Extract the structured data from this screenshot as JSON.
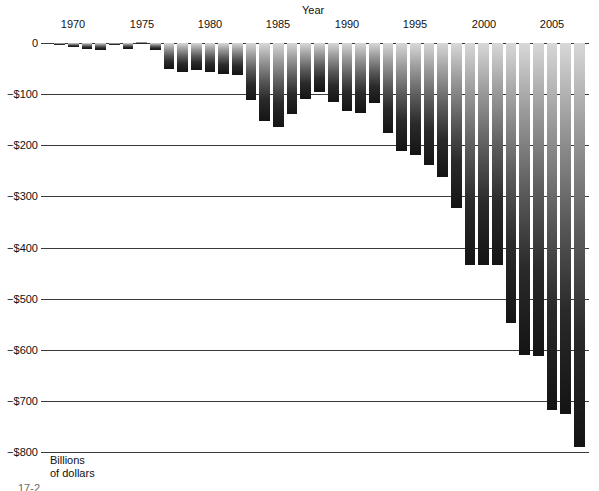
{
  "chart_data": {
    "type": "bar",
    "title": "",
    "xlabel": "Year",
    "ylabel": "Billions\nof dollars",
    "ylim": [
      -800,
      0
    ],
    "xlim": [
      1968.3,
      2007.7
    ],
    "grid": true,
    "legend": null,
    "ytick_labels": [
      "0",
      "−$100",
      "−$200",
      "−$300",
      "−$400",
      "−$500",
      "−$600",
      "−$700",
      "−$800"
    ],
    "ytick_values": [
      0,
      -100,
      -200,
      -300,
      -400,
      -500,
      -600,
      -700,
      -800
    ],
    "xtick_labels": [
      "1970",
      "1975",
      "1980",
      "1985",
      "1990",
      "1995",
      "2000",
      "2005"
    ],
    "xtick_values": [
      1970,
      1975,
      1980,
      1985,
      1990,
      1995,
      2000,
      2005
    ],
    "categories": [
      1969,
      1970,
      1971,
      1972,
      1973,
      1974,
      1975,
      1976,
      1977,
      1978,
      1979,
      1980,
      1981,
      1982,
      1983,
      1984,
      1985,
      1986,
      1987,
      1988,
      1989,
      1990,
      1991,
      1992,
      1993,
      1994,
      1995,
      1996,
      1997,
      1998,
      1999,
      2000,
      2001,
      2002,
      2003,
      2004,
      2005,
      2006,
      2007
    ],
    "values": [
      -3,
      -8,
      -12,
      -14,
      -3,
      -11,
      2,
      -13,
      -50,
      -56,
      -53,
      -56,
      -61,
      -62,
      -112,
      -152,
      -164,
      -139,
      -109,
      -95,
      -115,
      -133,
      -136,
      -118,
      -177,
      -211,
      -220,
      -239,
      -262,
      -322,
      -434,
      -434,
      -434,
      -547,
      -611,
      -612,
      -718,
      -725,
      -790
    ],
    "annotations": []
  },
  "axis": {
    "x_title": "Year",
    "y_caption_line1": "Billions",
    "y_caption_line2": "of dollars"
  },
  "footer": {
    "cut_text": "17-2"
  }
}
